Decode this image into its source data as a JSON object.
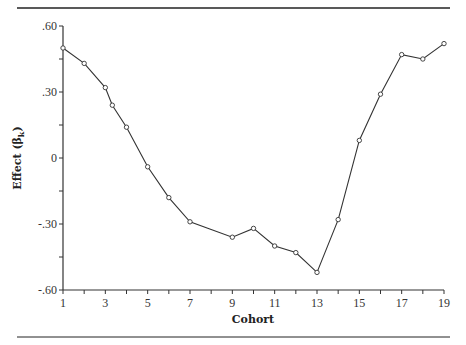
{
  "chart_data": {
    "type": "line",
    "title": "",
    "xlabel": "Cohort",
    "ylabel": "Effect (β",
    "ylabel_sub": "k",
    "ylabel_close": ")",
    "xlim": [
      1,
      19
    ],
    "ylim": [
      -0.6,
      0.6
    ],
    "x_ticks": [
      1,
      3,
      5,
      7,
      9,
      11,
      13,
      15,
      17,
      19
    ],
    "x_tick_labels": [
      "1",
      "3",
      "5",
      "7",
      "9",
      "11",
      "13",
      "15",
      "17",
      "19"
    ],
    "x_minor_ticks": [
      2,
      4,
      6,
      8,
      10,
      12,
      14,
      16,
      18
    ],
    "y_ticks": [
      0.6,
      0.3,
      0,
      -0.3,
      -0.6
    ],
    "y_tick_labels": [
      ".60",
      ".30",
      "0",
      "-.30",
      "-.60"
    ],
    "y_minor_ticks": [
      0.45,
      0.15,
      -0.15,
      -0.45
    ],
    "grid": false,
    "legend": null,
    "series": [
      {
        "name": "Effect",
        "marker": "open-circle",
        "color": "#333333",
        "x": [
          1,
          2,
          3,
          3.33,
          4,
          5,
          6,
          7,
          9,
          10,
          11,
          12,
          13,
          14,
          15,
          16,
          17,
          18,
          19
        ],
        "y": [
          0.5,
          0.43,
          0.32,
          0.24,
          0.14,
          -0.04,
          -0.18,
          -0.29,
          -0.36,
          -0.32,
          -0.4,
          -0.43,
          -0.52,
          -0.28,
          0.08,
          0.29,
          0.47,
          0.45,
          0.52
        ]
      }
    ]
  }
}
